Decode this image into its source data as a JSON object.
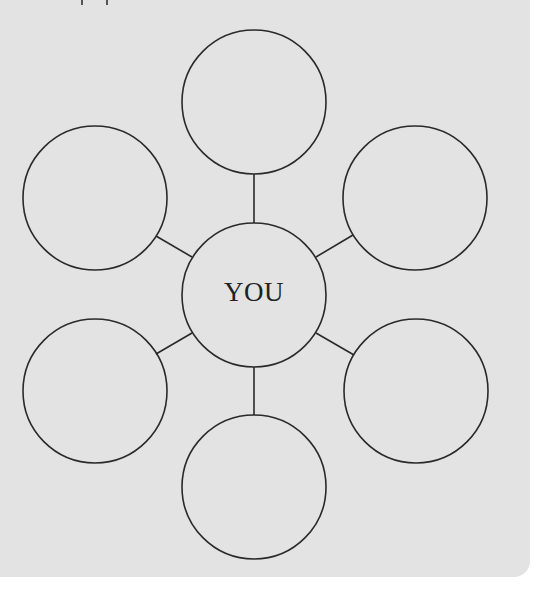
{
  "diagram": {
    "type": "hub-and-spoke",
    "hub": {
      "label": "YOU",
      "cx": 254,
      "cy": 295,
      "r": 72
    },
    "satellites": [
      {
        "position": "top",
        "label": "",
        "cx": 254,
        "cy": 102,
        "r": 72
      },
      {
        "position": "upper-right",
        "label": "",
        "cx": 415,
        "cy": 198,
        "r": 72
      },
      {
        "position": "lower-right",
        "label": "",
        "cx": 416,
        "cy": 391,
        "r": 72
      },
      {
        "position": "bottom",
        "label": "",
        "cx": 254,
        "cy": 487,
        "r": 72
      },
      {
        "position": "lower-left",
        "label": "",
        "cx": 95,
        "cy": 391,
        "r": 72
      },
      {
        "position": "upper-left",
        "label": "",
        "cx": 95,
        "cy": 198,
        "r": 72
      }
    ],
    "connectors": [
      {
        "to": "top",
        "x1": 254,
        "y1": 223,
        "x2": 254,
        "y2": 174
      },
      {
        "to": "upper-right",
        "x1": 316,
        "y1": 257,
        "x2": 353,
        "y2": 235
      },
      {
        "to": "lower-right",
        "x1": 316,
        "y1": 333,
        "x2": 354,
        "y2": 355
      },
      {
        "to": "bottom",
        "x1": 254,
        "y1": 367,
        "x2": 254,
        "y2": 415
      },
      {
        "to": "lower-left",
        "x1": 192,
        "y1": 333,
        "x2": 156,
        "y2": 354
      },
      {
        "to": "upper-left",
        "x1": 192,
        "y1": 257,
        "x2": 156,
        "y2": 236
      }
    ]
  },
  "colors": {
    "panel_background": "#e3e3e3",
    "page_background": "#ffffff",
    "stroke": "#2a2a2a",
    "text": "#222222"
  }
}
